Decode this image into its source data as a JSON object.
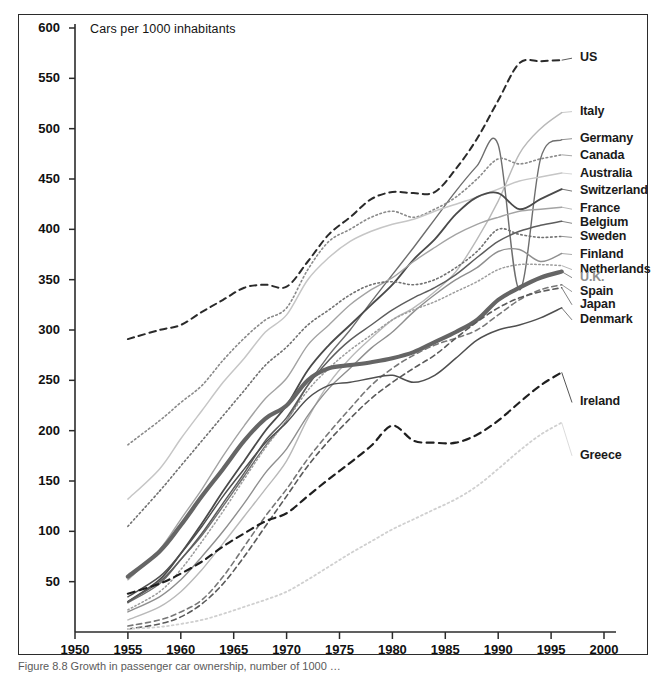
{
  "figure": {
    "axis_note": "Cars per 1000 inhabitants",
    "caption": "Figure 8.8  Growth in passenger car ownership, number of 1000 …"
  },
  "axes": {
    "y_ticks": [
      "600",
      "550",
      "500",
      "450",
      "400",
      "350",
      "300",
      "250",
      "200",
      "150",
      "100",
      "50"
    ],
    "x_ticks": [
      "1950",
      "1955",
      "1960",
      "1965",
      "1970",
      "1975",
      "1980",
      "1985",
      "1990",
      "1995",
      "2000"
    ]
  },
  "labels": {
    "us": "US",
    "italy": "Italy",
    "germany": "Germany",
    "canada": "Canada",
    "australia": "Australia",
    "switzerland": "Switzerland",
    "france": "France",
    "belgium": "Belgium",
    "sweden": "Sweden",
    "finland": "Finland",
    "netherlands": "Netherlands",
    "uk": "U.K.",
    "spain": "Spain",
    "japan": "Japan",
    "denmark": "Denmark",
    "ireland": "Ireland",
    "greece": "Greece"
  },
  "chart_data": {
    "type": "line",
    "title": "",
    "subtitle": "",
    "xlabel": "",
    "ylabel": "Cars per 1000 inhabitants",
    "xlim": [
      1950,
      2000
    ],
    "ylim": [
      0,
      600
    ],
    "x_tick_step": 5,
    "y_tick_step": 50,
    "grid": false,
    "legend_position": "right-inline-labels",
    "x": [
      1955,
      1958,
      1960,
      1962,
      1964,
      1966,
      1968,
      1970,
      1972,
      1974,
      1976,
      1978,
      1980,
      1982,
      1984,
      1986,
      1988,
      1990,
      1992,
      1994,
      1996
    ],
    "series": [
      {
        "name": "US",
        "style": "dashed",
        "color": "#2a2a2a",
        "width": 2.0,
        "label_y_value": 570,
        "values": [
          291,
          300,
          305,
          318,
          330,
          342,
          345,
          343,
          368,
          395,
          412,
          430,
          437,
          436,
          437,
          460,
          490,
          528,
          565,
          567,
          568
        ]
      },
      {
        "name": "Italy",
        "style": "solid",
        "color": "#b9b9b9",
        "width": 1.4,
        "label_y_value": 517,
        "values": [
          12,
          25,
          40,
          62,
          88,
          115,
          142,
          170,
          212,
          247,
          272,
          292,
          310,
          322,
          338,
          358,
          390,
          428,
          475,
          500,
          516
        ]
      },
      {
        "name": "Germany",
        "style": "solid",
        "color": "#6e6e6e",
        "width": 1.4,
        "label_y_value": 490,
        "values": [
          29,
          48,
          72,
          96,
          125,
          155,
          185,
          210,
          245,
          275,
          300,
          328,
          355,
          382,
          410,
          438,
          463,
          484,
          340,
          470,
          489
        ]
      },
      {
        "name": "Canada",
        "style": "dotted",
        "color": "#8a8a8a",
        "width": 1.6,
        "label_y_value": 473,
        "values": [
          186,
          210,
          228,
          245,
          270,
          292,
          310,
          322,
          360,
          388,
          400,
          412,
          418,
          412,
          420,
          432,
          450,
          470,
          465,
          470,
          474
        ]
      },
      {
        "name": "Australia",
        "style": "solid",
        "color": "#c6c6c6",
        "width": 1.5,
        "label_y_value": 455,
        "values": [
          132,
          162,
          192,
          220,
          248,
          272,
          298,
          315,
          350,
          372,
          388,
          398,
          405,
          410,
          418,
          425,
          432,
          440,
          448,
          452,
          456
        ]
      },
      {
        "name": "Switzerland",
        "style": "solid",
        "color": "#4a4a4a",
        "width": 1.8,
        "label_y_value": 438,
        "values": [
          30,
          52,
          78,
          108,
          140,
          170,
          200,
          225,
          260,
          285,
          305,
          325,
          345,
          370,
          390,
          415,
          432,
          436,
          420,
          430,
          440
        ]
      },
      {
        "name": "France",
        "style": "solid",
        "color": "#a3a3a3",
        "width": 1.4,
        "label_y_value": 420,
        "values": [
          52,
          82,
          112,
          142,
          175,
          205,
          232,
          252,
          285,
          305,
          325,
          340,
          352,
          368,
          382,
          395,
          405,
          412,
          418,
          420,
          422
        ]
      },
      {
        "name": "Belgium",
        "style": "solid",
        "color": "#5d5d5d",
        "width": 1.5,
        "label_y_value": 406,
        "values": [
          30,
          50,
          72,
          98,
          128,
          158,
          190,
          213,
          245,
          270,
          290,
          305,
          320,
          332,
          342,
          355,
          372,
          388,
          398,
          404,
          408
        ]
      },
      {
        "name": "Sweden",
        "style": "dotted",
        "color": "#717171",
        "width": 1.6,
        "label_y_value": 392,
        "values": [
          105,
          140,
          165,
          190,
          215,
          240,
          265,
          283,
          305,
          320,
          335,
          345,
          348,
          345,
          350,
          362,
          378,
          400,
          395,
          392,
          393
        ]
      },
      {
        "name": "Finland",
        "style": "solid",
        "color": "#8f8f8f",
        "width": 1.4,
        "label_y_value": 375,
        "values": [
          20,
          35,
          52,
          75,
          100,
          128,
          158,
          182,
          215,
          242,
          262,
          282,
          298,
          318,
          335,
          350,
          362,
          378,
          380,
          368,
          376
        ]
      },
      {
        "name": "Netherlands",
        "style": "dotted",
        "color": "#9c9c9c",
        "width": 1.5,
        "label_y_value": 360,
        "values": [
          22,
          40,
          62,
          90,
          120,
          152,
          183,
          210,
          240,
          262,
          280,
          295,
          310,
          320,
          328,
          338,
          348,
          360,
          365,
          365,
          364
        ]
      },
      {
        "name": "U.K.",
        "style": "solid",
        "color": "#656565",
        "width": 4.2,
        "label_y_value": 352,
        "values": [
          55,
          80,
          106,
          135,
          162,
          190,
          212,
          225,
          250,
          262,
          265,
          268,
          272,
          278,
          288,
          298,
          310,
          330,
          342,
          352,
          358
        ]
      },
      {
        "name": "Spain",
        "style": "dashed",
        "color": "#777777",
        "width": 1.6,
        "label_y_value": 338,
        "values": [
          6,
          12,
          20,
          32,
          55,
          85,
          115,
          142,
          172,
          198,
          222,
          245,
          262,
          275,
          285,
          292,
          300,
          315,
          330,
          340,
          345
        ]
      },
      {
        "name": "Japan",
        "style": "dashed",
        "color": "#5a5a5a",
        "width": 1.6,
        "label_y_value": 325,
        "values": [
          3,
          8,
          15,
          28,
          48,
          75,
          105,
          135,
          165,
          190,
          212,
          232,
          248,
          262,
          275,
          292,
          308,
          322,
          332,
          338,
          342
        ]
      },
      {
        "name": "Denmark",
        "style": "solid",
        "color": "#4f4f4f",
        "width": 1.5,
        "label_y_value": 310,
        "values": [
          35,
          55,
          78,
          105,
          135,
          162,
          188,
          208,
          232,
          245,
          248,
          252,
          255,
          248,
          255,
          272,
          290,
          300,
          305,
          312,
          322
        ]
      },
      {
        "name": "Ireland",
        "style": "dashed",
        "color": "#1f1f1f",
        "width": 2.2,
        "label_y_value": 228,
        "values": [
          38,
          48,
          58,
          70,
          85,
          98,
          110,
          118,
          135,
          152,
          168,
          185,
          205,
          190,
          188,
          188,
          196,
          210,
          228,
          245,
          258
        ]
      },
      {
        "name": "Greece",
        "style": "dotted",
        "color": "#d0d0d0",
        "width": 1.8,
        "label_y_value": 175,
        "values": [
          3,
          5,
          8,
          12,
          18,
          25,
          32,
          40,
          52,
          65,
          78,
          90,
          102,
          112,
          122,
          132,
          145,
          162,
          180,
          196,
          208
        ]
      }
    ],
    "annotations": [
      {
        "text": "German reunification dip",
        "x": 1991,
        "y": 340
      }
    ]
  }
}
